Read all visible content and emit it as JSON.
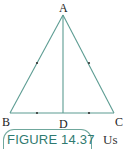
{
  "figure": {
    "caption": "FIGURE 14.37",
    "trailing_text": "Us",
    "colors": {
      "line": "#5c9c92",
      "caption": "#2f7a70",
      "caption_border": "#6fa79c"
    },
    "points": {
      "A": {
        "label": "A",
        "x": 63,
        "y": 15
      },
      "B": {
        "label": "B",
        "x": 10,
        "y": 113
      },
      "C": {
        "label": "C",
        "x": 114,
        "y": 113
      },
      "D": {
        "label": "D",
        "x": 63,
        "y": 113
      }
    },
    "segments": [
      "AB",
      "AC",
      "BC",
      "AD"
    ],
    "equal_marks": [
      [
        "AB",
        "AC"
      ],
      [
        "BD",
        "DC"
      ]
    ]
  }
}
